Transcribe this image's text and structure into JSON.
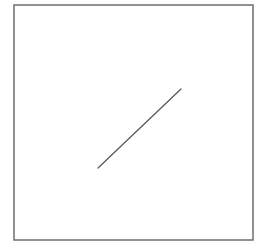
{
  "diagram": {
    "background": "#ffffff",
    "frame": {
      "x": 14,
      "y": 5,
      "width": 239,
      "height": 235,
      "stroke": "#6e6e6e",
      "stroke_width": 1.5
    },
    "line": {
      "x1": 98,
      "y1": 168,
      "x2": 181,
      "y2": 89,
      "stroke": "#5a5a5a",
      "stroke_width": 1.3
    }
  }
}
